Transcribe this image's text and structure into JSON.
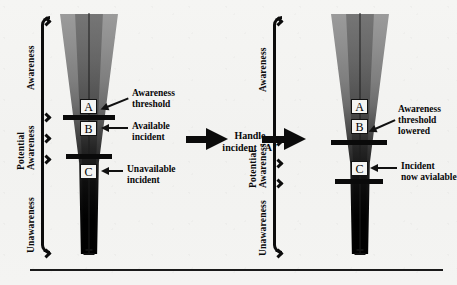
{
  "figure": {
    "type": "conceptual-diagram"
  },
  "panels": [
    {
      "id": "before",
      "scale_labels": {
        "awareness": "Awareness",
        "potential_line1": "Potential",
        "potential_line2": "Awareness",
        "unawareness": "Unawareness"
      },
      "incidents": [
        {
          "id": "A",
          "label": "A"
        },
        {
          "id": "B",
          "label": "B"
        },
        {
          "id": "C",
          "label": "C"
        }
      ],
      "callouts": [
        {
          "id": "threshold",
          "line1": "Awareness",
          "line2": "threshold"
        },
        {
          "id": "available",
          "line1": "Available",
          "line2": "incident"
        },
        {
          "id": "unavailable",
          "line1": "Unavailable",
          "line2": "incident"
        }
      ]
    },
    {
      "id": "after",
      "scale_labels": {
        "awareness": "Awareness",
        "potential_line1": "Potential",
        "potential_line2": "Awareness",
        "unawareness": "Unawareness"
      },
      "incidents": [
        {
          "id": "A",
          "label": "A"
        },
        {
          "id": "B",
          "label": "B"
        },
        {
          "id": "C",
          "label": "C"
        }
      ],
      "callouts": [
        {
          "id": "threshold-lowered",
          "line1": "Awareness",
          "line2": "threshold",
          "line3": "lowered"
        },
        {
          "id": "incident-available",
          "line1": "Incident",
          "line2": "now avialable"
        }
      ]
    }
  ],
  "transition": {
    "line1": "Handle",
    "line2": "incident \"A\""
  },
  "colors": {
    "ink": "#0b0b0b",
    "paper": "#f3f3f1",
    "funnel_top": "#9b9b9b",
    "funnel_bottom": "#000000"
  }
}
